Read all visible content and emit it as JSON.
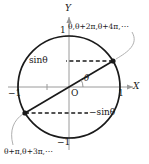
{
  "figure": {
    "axes": {
      "x_label": "X",
      "y_label": "Y",
      "x_tick_neg": "−1",
      "x_tick_pos": "1",
      "y_tick_pos": "1",
      "y_tick_neg": "−1",
      "origin_label": "O"
    },
    "labels": {
      "sin_positive": "sinθ",
      "sin_negative": "−sinθ",
      "angle": "θ",
      "note_top": "θ,θ+2π,θ+4π,⋯",
      "note_bottom": "θ+π,θ+3π,⋯"
    },
    "colors": {
      "circle_stroke": "#1a1a1a",
      "axis_stroke": "#9a9a9a",
      "diameter_stroke": "#1a1a1a",
      "dashed_stroke": "#1a1a1a",
      "leader_stroke": "#b0b0b0",
      "point_fill": "#1a1a1a",
      "text": "#1a1a1a",
      "background": "#ffffff"
    },
    "geometry": {
      "center_x": 69,
      "center_y": 87,
      "radius": 51,
      "point_upper_x": 113,
      "point_upper_y": 61,
      "point_lower_x": 25,
      "point_lower_y": 113
    }
  }
}
